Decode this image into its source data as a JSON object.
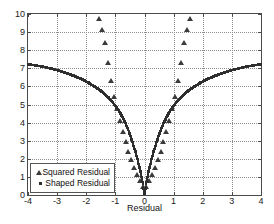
{
  "chart_data": {
    "type": "scatter",
    "title": "",
    "xlabel": "Residual",
    "ylabel": "",
    "xlim": [
      -4,
      4
    ],
    "ylim": [
      0,
      10
    ],
    "xticks": [
      -4,
      -3,
      -2,
      -1,
      0,
      1,
      2,
      3,
      4
    ],
    "xticklabels": [
      "-4",
      "-3",
      "-2",
      "-1",
      "0",
      "1",
      "2",
      "3",
      "4"
    ],
    "yticks": [
      0,
      1,
      2,
      3,
      4,
      5,
      6,
      7,
      8,
      9,
      10
    ],
    "yticklabels": [
      "0",
      "1",
      "2",
      "3",
      "4",
      "5",
      "6",
      "7",
      "8",
      "9",
      "10"
    ],
    "grid": true,
    "grid_style": "dotted",
    "legend_position": "lower left",
    "series": [
      {
        "name": "Squared Residual",
        "marker": "triangle",
        "color": "#3a3a3a",
        "x": [
          -1.55,
          -1.45,
          -1.35,
          -1.25,
          -1.15,
          -1.05,
          -0.95,
          -0.85,
          -0.75,
          -0.65,
          -0.55,
          -0.45,
          -0.35,
          -0.25,
          -0.15,
          -0.05,
          0.05,
          0.15,
          0.25,
          0.35,
          0.45,
          0.55,
          0.65,
          0.75,
          0.85,
          0.95,
          1.05,
          1.15,
          1.25,
          1.35,
          1.45,
          1.55
        ],
        "values": [
          9.7,
          9.1,
          8.4,
          7.3,
          6.3,
          5.4,
          4.75,
          4.1,
          3.5,
          2.95,
          2.4,
          1.95,
          1.5,
          1.1,
          0.75,
          0.45,
          0.45,
          0.75,
          1.1,
          1.5,
          1.95,
          2.4,
          2.95,
          3.5,
          4.1,
          4.75,
          5.4,
          6.3,
          7.3,
          8.4,
          9.1,
          9.7
        ]
      },
      {
        "name": "Shaped Residual",
        "marker": "dot",
        "color": "#2e2e2e",
        "x": [
          -4.0,
          -3.9,
          -3.8,
          -3.7,
          -3.6,
          -3.5,
          -3.4,
          -3.3,
          -3.2,
          -3.1,
          -3.0,
          -2.9,
          -2.8,
          -2.7,
          -2.6,
          -2.5,
          -2.4,
          -2.3,
          -2.2,
          -2.1,
          -2.0,
          -1.9,
          -1.8,
          -1.7,
          -1.6,
          -1.5,
          -1.4,
          -1.3,
          -1.2,
          -1.1,
          -1.0,
          -0.9,
          -0.8,
          -0.7,
          -0.6,
          -0.5,
          -0.4,
          -0.3,
          -0.2,
          -0.1,
          0.0,
          0.1,
          0.2,
          0.3,
          0.4,
          0.5,
          0.6,
          0.7,
          0.8,
          0.9,
          1.0,
          1.1,
          1.2,
          1.3,
          1.4,
          1.5,
          1.6,
          1.7,
          1.8,
          1.9,
          2.0,
          2.1,
          2.2,
          2.3,
          2.4,
          2.5,
          2.6,
          2.7,
          2.8,
          2.9,
          3.0,
          3.1,
          3.2,
          3.3,
          3.4,
          3.5,
          3.6,
          3.7,
          3.8,
          3.9,
          4.0
        ],
        "values": [
          7.22,
          7.2,
          7.18,
          7.15,
          7.12,
          7.09,
          7.06,
          7.02,
          6.98,
          6.94,
          6.9,
          6.85,
          6.8,
          6.75,
          6.69,
          6.63,
          6.57,
          6.5,
          6.43,
          6.35,
          6.27,
          6.18,
          6.08,
          5.98,
          5.87,
          5.75,
          5.62,
          5.47,
          5.31,
          5.13,
          4.93,
          4.7,
          4.43,
          4.12,
          3.76,
          3.34,
          2.86,
          2.32,
          1.72,
          1.0,
          0.05,
          1.0,
          1.72,
          2.32,
          2.86,
          3.34,
          3.76,
          4.12,
          4.43,
          4.7,
          4.93,
          5.13,
          5.31,
          5.47,
          5.62,
          5.75,
          5.87,
          5.98,
          6.08,
          6.18,
          6.27,
          6.35,
          6.43,
          6.5,
          6.57,
          6.63,
          6.69,
          6.75,
          6.8,
          6.85,
          6.9,
          6.94,
          6.98,
          7.02,
          7.06,
          7.09,
          7.12,
          7.15,
          7.18,
          7.2,
          7.22
        ]
      }
    ]
  },
  "legend": {
    "entries": [
      {
        "label": "Squared Residual",
        "marker": "triangle-icon"
      },
      {
        "label": "Shaped Residual",
        "marker": "square-dot-icon"
      }
    ]
  },
  "colors": {
    "axis": "#4a4a4a",
    "grid": "#8d8d8d",
    "text": "#111111",
    "background": "#ffffff",
    "squared_series": "#3a3a3a",
    "shaped_series": "#2e2e2e"
  }
}
